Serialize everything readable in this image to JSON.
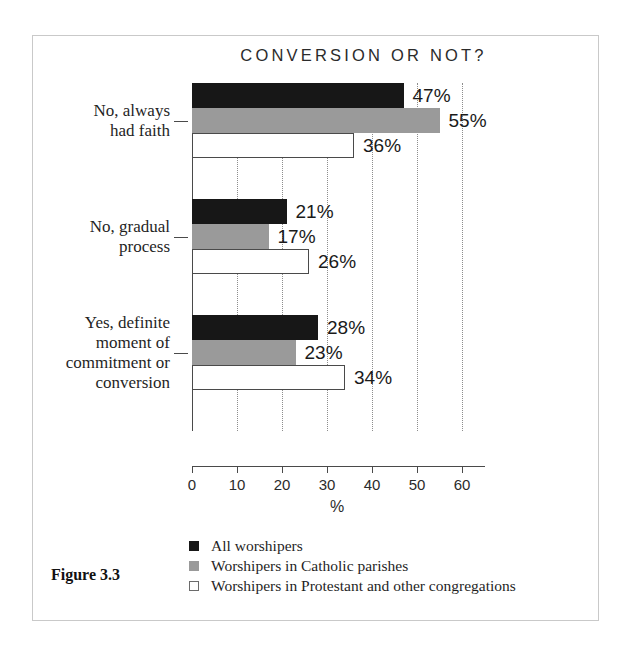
{
  "figure": {
    "caption": "Figure 3.3"
  },
  "chart_data": {
    "type": "bar",
    "orientation": "horizontal",
    "title": "CONVERSION OR NOT?",
    "xlabel": "%",
    "ylabel": "",
    "xlim": [
      0,
      60
    ],
    "xticks": [
      0,
      10,
      20,
      30,
      40,
      50,
      60
    ],
    "xtick_labels": [
      "0",
      "10",
      "20",
      "30",
      "40",
      "50",
      "60"
    ],
    "grid": "vertical-dotted",
    "legend_position": "bottom-left",
    "categories": [
      "No, always had faith",
      "No, gradual process",
      "Yes, definite moment of commitment or conversion"
    ],
    "category_label_lines": [
      [
        "No, always",
        "had faith"
      ],
      [
        "No, gradual",
        "process"
      ],
      [
        "Yes, definite",
        "moment of",
        "commitment or",
        "conversion"
      ]
    ],
    "series": [
      {
        "name": "All worshipers",
        "color": "#171717",
        "values": [
          47,
          55,
          28
        ],
        "value_labels": [
          "47%",
          "21%",
          "28%"
        ]
      },
      {
        "name": "Worshipers in Catholic parishes",
        "color": "#9a9a9a",
        "values": [
          55,
          17,
          23
        ],
        "value_labels": [
          "55%",
          "17%",
          "23%"
        ]
      },
      {
        "name": "Worshipers in Protestant and other congregations",
        "color": "#ffffff",
        "values": [
          36,
          26,
          34
        ],
        "value_labels": [
          "36%",
          "26%",
          "34%"
        ]
      }
    ],
    "groups": [
      {
        "category": "No, always had faith",
        "bars": [
          {
            "series": "All worshipers",
            "value": 47,
            "label": "47%"
          },
          {
            "series": "Worshipers in Catholic parishes",
            "value": 55,
            "label": "55%"
          },
          {
            "series": "Worshipers in Protestant and other congregations",
            "value": 36,
            "label": "36%"
          }
        ]
      },
      {
        "category": "No, gradual process",
        "bars": [
          {
            "series": "All worshipers",
            "value": 21,
            "label": "21%"
          },
          {
            "series": "Worshipers in Catholic parishes",
            "value": 17,
            "label": "17%"
          },
          {
            "series": "Worshipers in Protestant and other congregations",
            "value": 26,
            "label": "26%"
          }
        ]
      },
      {
        "category": "Yes, definite moment of commitment or conversion",
        "bars": [
          {
            "series": "All worshipers",
            "value": 28,
            "label": "28%"
          },
          {
            "series": "Worshipers in Catholic parishes",
            "value": 23,
            "label": "23%"
          },
          {
            "series": "Worshipers in Protestant and other congregations",
            "value": 34,
            "label": "34%"
          }
        ]
      }
    ],
    "legend": [
      {
        "label": "All worshipers",
        "color": "#171717",
        "style": "filled"
      },
      {
        "label": "Worshipers in Catholic parishes",
        "color": "#9a9a9a",
        "style": "filled"
      },
      {
        "label": "Worshipers in Protestant and other congregations",
        "color": "#ffffff",
        "style": "outlined"
      }
    ]
  }
}
